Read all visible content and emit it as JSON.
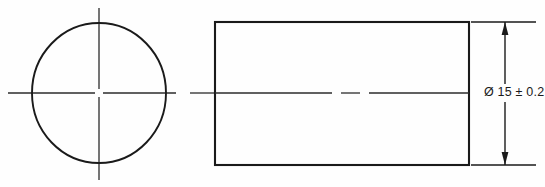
{
  "drawing": {
    "title": "Shaft end view and side view with diameter dimension",
    "background_color": "#fefefe",
    "line_color": "#1a1a1a",
    "centerline_color": "#2b2b2b",
    "views": {
      "end_view": {
        "name": "circular end view",
        "shape": "circle",
        "center_x": 99,
        "center_y": 93,
        "radius_x": 67,
        "radius_y": 70
      },
      "side_view": {
        "name": "rectangular side view",
        "shape": "rectangle",
        "left": 215,
        "top": 22,
        "right": 469,
        "bottom": 165
      }
    },
    "centerlines": {
      "horizontal_y": 93,
      "horizontal_start_x": 8,
      "horizontal_end_x": 470,
      "vertical_x": 99,
      "vertical_start_y": 8,
      "vertical_end_y": 180
    },
    "dimensions": [
      {
        "id": "diameter",
        "label": "Ø 15 ± 0.2",
        "symbol": "Ø",
        "nominal_value": "15",
        "tolerance_symbol": "±",
        "tolerance_value": "0.2",
        "orientation": "vertical",
        "dimension_line_x": 505,
        "arrow_top_y": 22,
        "arrow_bottom_y": 165,
        "extension_line_top_y": 22,
        "extension_line_bottom_y": 165,
        "extension_line_start_x": 469,
        "extension_line_end_x": 536
      }
    ]
  }
}
